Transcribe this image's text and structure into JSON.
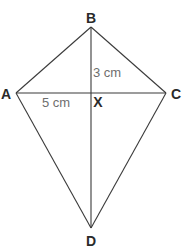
{
  "diagram": {
    "type": "kite",
    "vertices": {
      "A": "A",
      "B": "B",
      "C": "C",
      "D": "D"
    },
    "intersection_label": "X",
    "measurements": {
      "BX": "3 cm",
      "AX": "5 cm"
    },
    "colors": {
      "line": "#3a3a3a",
      "vertex_label": "#2a2a2a",
      "measure_label": "#6e6e6e"
    }
  }
}
